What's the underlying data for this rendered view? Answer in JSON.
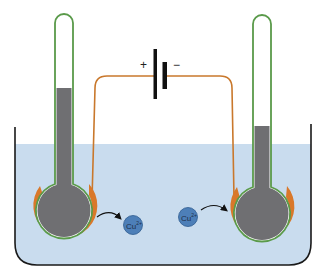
{
  "diagram": {
    "type": "electrolytic-cell",
    "battery": {
      "positive_label": "+",
      "negative_label": "−"
    },
    "ions": [
      {
        "label": "Cu",
        "charge": "2+",
        "side": "left",
        "direction": "leaving anode"
      },
      {
        "label": "Cu",
        "charge": "2+",
        "side": "right",
        "direction": "moving to cathode"
      }
    ],
    "electrodes": [
      {
        "side": "left",
        "role": "anode",
        "connected_to": "+",
        "fill_level": "high"
      },
      {
        "side": "right",
        "role": "cathode",
        "connected_to": "−",
        "fill_level": "lower"
      }
    ],
    "colors": {
      "electrolyte": "#c9dcee",
      "container_outline": "#1a1a1a",
      "tube_outline": "#5a9a4a",
      "tube_fill": "#6f6f72",
      "copper": "#d9782a",
      "wire": "#c9782c",
      "ion": "#4d7fb8",
      "battery": "#111111"
    }
  }
}
